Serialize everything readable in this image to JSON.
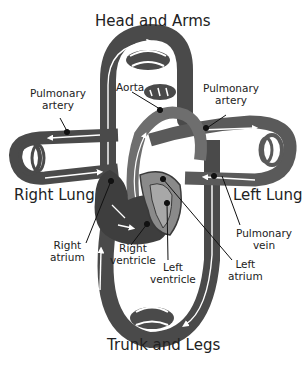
{
  "diagram": {
    "title_top": "Head and Arms",
    "title_bottom": "Trunk and Legs",
    "regions": {
      "right_lung": "Right Lung",
      "left_lung": "Left Lung"
    },
    "labels": {
      "pulmonary_artery_left": [
        "Pulmonary",
        "artery"
      ],
      "pulmonary_artery_right": [
        "Pulmonary",
        "artery"
      ],
      "aorta": "Aorta",
      "right_atrium": [
        "Right",
        "atrium"
      ],
      "right_ventricle": [
        "Right",
        "ventricle"
      ],
      "left_ventricle": [
        "Left",
        "ventricle"
      ],
      "left_atrium": [
        "Left",
        "atrium"
      ],
      "pulmonary_vein": [
        "Pulmonary",
        "vein"
      ]
    },
    "colors": {
      "vessel_dark": "#4a4a4a",
      "vessel_mid": "#6e6e6e",
      "vessel_light": "#9a9a9a",
      "flow_arrow": "#ffffff",
      "background": "#ffffff",
      "leader_line": "#111111"
    }
  }
}
